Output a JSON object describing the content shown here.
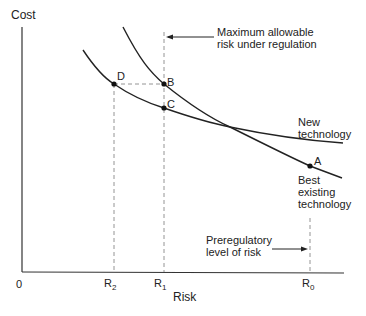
{
  "axes": {
    "y_label": "Cost",
    "x_label": "Risk",
    "origin_label": "0"
  },
  "ticks": [
    {
      "name": "R",
      "sub": "2"
    },
    {
      "name": "R",
      "sub": "1"
    },
    {
      "name": "R",
      "sub": "0"
    }
  ],
  "points": {
    "A": "A",
    "B": "B",
    "C": "C",
    "D": "D"
  },
  "curves": {
    "new_technology": [
      "New",
      "technology"
    ],
    "best_existing": [
      "Best",
      "existing",
      "technology"
    ]
  },
  "annotations": {
    "max_allowable": [
      "Maximum allowable",
      "risk under regulation"
    ],
    "preregulatory": [
      "Preregulatory",
      "level of risk"
    ]
  },
  "colors": {
    "line": "#222222",
    "dashed": "#888888"
  }
}
